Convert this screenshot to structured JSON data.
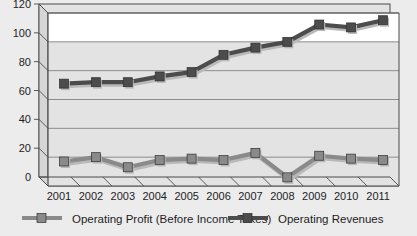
{
  "chart_data": {
    "type": "line",
    "title": "",
    "subtitle": "",
    "xlabel": "",
    "ylabel": "",
    "categories": [
      "2001",
      "2002",
      "2003",
      "2004",
      "2005",
      "2006",
      "2007",
      "2008",
      "2009",
      "2010",
      "2011"
    ],
    "ylim": [
      0,
      120
    ],
    "yticks": [
      0,
      20,
      40,
      60,
      80,
      100,
      120
    ],
    "ytick_labels": [
      "0",
      "20",
      "40",
      "60",
      "80",
      "100",
      "120"
    ],
    "grid": true,
    "grid_axis": "y",
    "legend_position": "bottom",
    "style": "3d-line-with-square-markers",
    "series": [
      {
        "name": "Operating Profit (Before Income Taxes)",
        "color": "#8a8a8a",
        "values": [
          17,
          20,
          13,
          18,
          19,
          18,
          23,
          6,
          21,
          19,
          18
        ]
      },
      {
        "name": "Operating Revenues",
        "color": "#4c4c4c",
        "values": [
          71,
          72,
          72,
          76,
          79,
          91,
          96,
          100,
          112,
          110,
          115
        ]
      }
    ]
  },
  "colors": {
    "page_background": "#ececed",
    "plot_background": "#e3e3e3",
    "plot_top_band": "#ffffff",
    "gridline": "#8c8c8c",
    "axis": "#4a4a4a",
    "depth_face": "#d6d6d6",
    "text": "#1d1d1d",
    "series_profit": "#8a8a8a",
    "series_revenue": "#4c4c4c"
  },
  "legend": {
    "items": [
      {
        "label": "Operating Profit (Before Income Taxes)",
        "color": "#8a8a8a"
      },
      {
        "label": "Operating Revenues",
        "color": "#4c4c4c"
      }
    ]
  }
}
